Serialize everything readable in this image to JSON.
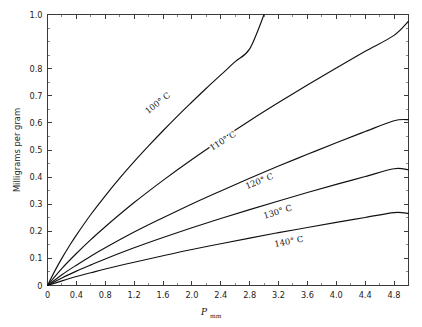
{
  "chart_data": {
    "type": "line",
    "title": "",
    "subtitle": "",
    "xlabel": "P",
    "xlabel_sub": "mm",
    "ylabel": "Milligrams per gram",
    "xlim": [
      0,
      5.0
    ],
    "ylim": [
      0,
      1.0
    ],
    "grid": false,
    "legend_position": "inline-curve-labels",
    "x_ticks": [
      "0",
      "0.4",
      "0.8",
      "1.2",
      "1.6",
      "2.0",
      "2.4",
      "2.8",
      "3.2",
      "3.6",
      "4.0",
      "4.4",
      "4.8"
    ],
    "x_tick_values": [
      0,
      0.4,
      0.8,
      1.2,
      1.6,
      2.0,
      2.4,
      2.8,
      3.2,
      3.6,
      4.0,
      4.4,
      4.8
    ],
    "x_minor_tick_values": [
      0.2,
      0.6,
      1.0,
      1.4,
      1.8,
      2.2,
      2.6,
      3.0,
      3.4,
      3.8,
      4.2,
      4.6,
      5.0
    ],
    "y_ticks": [
      "1.0",
      "0.8",
      "0.7",
      "0.6",
      "0.5",
      "0.4",
      "0.3",
      "0.2",
      "0.1",
      "0"
    ],
    "y_tick_values": [
      1.0,
      0.8,
      0.7,
      0.6,
      0.5,
      0.4,
      0.3,
      0.2,
      0.1,
      0
    ],
    "y_minor_tick_values": [
      0.95,
      0.85,
      0.75,
      0.65,
      0.55,
      0.45,
      0.35,
      0.25,
      0.15,
      0.05
    ],
    "series": [
      {
        "name": "100° C",
        "label": "100° C",
        "color": "#111111",
        "x": [
          0,
          0.1,
          0.2,
          0.3,
          0.4,
          0.6,
          0.8,
          1.0,
          1.2,
          1.4,
          1.6,
          1.8,
          2.0,
          2.2,
          2.4,
          2.6,
          2.8,
          3.0
        ],
        "y": [
          0,
          0.053,
          0.101,
          0.145,
          0.186,
          0.262,
          0.331,
          0.396,
          0.457,
          0.515,
          0.571,
          0.625,
          0.677,
          0.728,
          0.777,
          0.826,
          0.873,
          1.0
        ]
      },
      {
        "name": "110° C",
        "label": "110° C",
        "color": "#111111",
        "x": [
          0,
          0.2,
          0.4,
          0.6,
          0.8,
          1.2,
          1.6,
          2.0,
          2.4,
          2.8,
          3.2,
          3.6,
          4.0,
          4.4,
          4.8,
          5.0
        ],
        "y": [
          0,
          0.063,
          0.118,
          0.169,
          0.217,
          0.306,
          0.388,
          0.465,
          0.538,
          0.608,
          0.675,
          0.74,
          0.803,
          0.864,
          0.923,
          0.975
        ]
      },
      {
        "name": "120° C",
        "label": "120° C",
        "color": "#111111",
        "x": [
          0,
          0.2,
          0.4,
          0.6,
          0.8,
          1.2,
          1.6,
          2.0,
          2.4,
          2.8,
          3.2,
          3.6,
          4.0,
          4.4,
          4.8,
          5.0
        ],
        "y": [
          0,
          0.04,
          0.075,
          0.108,
          0.139,
          0.197,
          0.25,
          0.301,
          0.349,
          0.396,
          0.441,
          0.484,
          0.527,
          0.568,
          0.608,
          0.612
        ]
      },
      {
        "name": "130° C",
        "label": "130° C",
        "color": "#111111",
        "x": [
          0,
          0.2,
          0.4,
          0.6,
          0.8,
          1.2,
          1.6,
          2.0,
          2.4,
          2.8,
          3.2,
          3.6,
          4.0,
          4.4,
          4.8,
          5.0
        ],
        "y": [
          0,
          0.028,
          0.053,
          0.076,
          0.098,
          0.139,
          0.177,
          0.213,
          0.247,
          0.28,
          0.312,
          0.343,
          0.373,
          0.402,
          0.431,
          0.427
        ]
      },
      {
        "name": "140° C",
        "label": "140° C",
        "color": "#111111",
        "x": [
          0,
          0.2,
          0.4,
          0.6,
          0.8,
          1.2,
          1.6,
          2.0,
          2.4,
          2.8,
          3.2,
          3.6,
          4.0,
          4.4,
          4.8,
          5.0
        ],
        "y": [
          0,
          0.017,
          0.033,
          0.047,
          0.061,
          0.086,
          0.11,
          0.133,
          0.154,
          0.175,
          0.195,
          0.214,
          0.233,
          0.251,
          0.269,
          0.266
        ]
      }
    ],
    "curve_label_positions": [
      {
        "label": "100° C",
        "x": 1.55,
        "y": 0.665,
        "rotate": -38
      },
      {
        "label": "110° C",
        "x": 2.45,
        "y": 0.525,
        "rotate": -32
      },
      {
        "label": "120° C",
        "x": 2.95,
        "y": 0.375,
        "rotate": -22
      },
      {
        "label": "130° C",
        "x": 3.2,
        "y": 0.262,
        "rotate": -17
      },
      {
        "label": "140° C",
        "x": 3.35,
        "y": 0.152,
        "rotate": -11
      }
    ]
  },
  "colors": {
    "background": "#ffffff",
    "axis": "#3a3a3a",
    "curve": "#111111",
    "text": "#1c1c1c"
  }
}
